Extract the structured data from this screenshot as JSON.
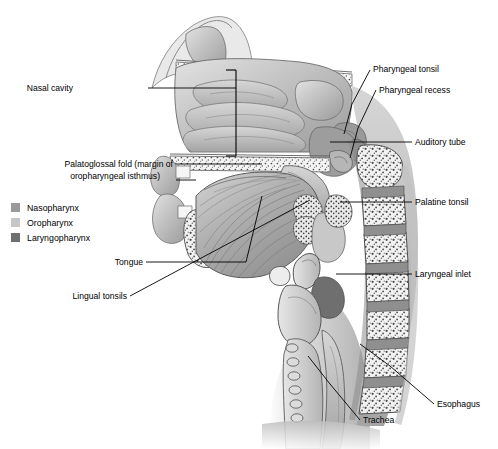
{
  "figure": {
    "type": "anatomical-illustration"
  },
  "legend": {
    "items": [
      {
        "label": "Nasopharynx",
        "color": "#9a9a9a"
      },
      {
        "label": "Oropharynx",
        "color": "#c6c6c6"
      },
      {
        "label": "Laryngopharynx",
        "color": "#6e6e6e"
      }
    ]
  },
  "labels": {
    "nasal_cavity": "Nasal cavity",
    "palatoglossal_fold_line1": "Palatoglossal fold (margin of",
    "palatoglossal_fold_line2": "oropharyngeal isthmus)",
    "tongue": "Tongue",
    "lingual_tonsils": "Lingual tonsils",
    "pharyngeal_tonsil": "Pharyngeal tonsil",
    "pharyngeal_recess": "Pharyngeal recess",
    "auditory_tube": "Auditory tube",
    "palatine_tonsil": "Palatine tonsil",
    "laryngeal_inlet": "Laryngeal inlet",
    "esophagus": "Esophagus",
    "trachea": "Trachea"
  },
  "colors": {
    "ink": "#2e2e2e",
    "tissue_light": "#d8d8d8",
    "tissue_mid": "#b2b2b2",
    "tissue_dark": "#8c8c8c",
    "bone_fill": "#eeeeee",
    "background": "#ffffff"
  }
}
